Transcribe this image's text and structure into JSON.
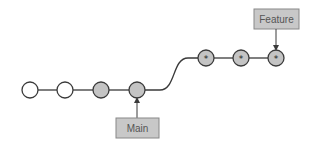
{
  "diagram": {
    "type": "git-branch",
    "colors": {
      "line": "#3a3a3a",
      "empty_commit_fill": "#ffffff",
      "main_commit_fill": "#c4c4c4",
      "feature_commit_fill": "#c4c4c4",
      "label_fill": "#c8c8c8",
      "label_stroke": "#888888",
      "label_text": "#555555"
    },
    "main_branch": {
      "commits": [
        {
          "x": 30,
          "y": 90,
          "style": "empty"
        },
        {
          "x": 65,
          "y": 90,
          "style": "empty"
        },
        {
          "x": 101,
          "y": 90,
          "style": "filled"
        },
        {
          "x": 137,
          "y": 90,
          "style": "filled"
        }
      ],
      "label": "Main"
    },
    "feature_branch": {
      "commits": [
        {
          "x": 206,
          "y": 58,
          "style": "star"
        },
        {
          "x": 241,
          "y": 58,
          "style": "star"
        },
        {
          "x": 276,
          "y": 58,
          "style": "star"
        }
      ],
      "label": "Feature"
    },
    "labels": {
      "main": "Main",
      "feature": "Feature"
    }
  }
}
